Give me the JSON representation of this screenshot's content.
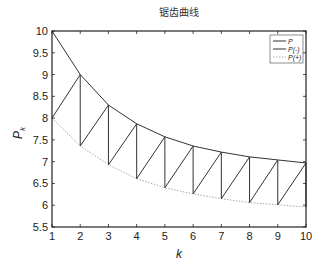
{
  "chart_data": {
    "type": "line",
    "title": "锯齿曲线",
    "xlabel": "k",
    "ylabel": "P_k",
    "ylabel_main": "P",
    "ylabel_sub": "k",
    "xlim": [
      1,
      10
    ],
    "ylim": [
      5.5,
      10
    ],
    "xticks": [
      "1",
      "2",
      "3",
      "4",
      "5",
      "6",
      "7",
      "8",
      "9",
      "10"
    ],
    "yticks": [
      "5.5",
      "6",
      "6.5",
      "7",
      "7.5",
      "8",
      "8.5",
      "9",
      "9.5",
      "10"
    ],
    "grid": false,
    "legend_position": "upper right",
    "x": [
      1,
      2,
      3,
      4,
      5,
      6,
      7,
      8,
      9,
      10
    ],
    "series": [
      {
        "name": "P",
        "style": "solid",
        "color": "#333333",
        "values": [
          10,
          9.0,
          8.3,
          7.87,
          7.57,
          7.36,
          7.22,
          7.11,
          7.04,
          6.97
        ]
      },
      {
        "name": "P(-)",
        "style": "solid-sawtooth",
        "color": "#333333",
        "values": [
          8.0,
          7.36,
          6.93,
          6.61,
          6.4,
          6.26,
          6.15,
          6.06,
          6.01,
          5.96
        ]
      },
      {
        "name": "P(+)",
        "style": "dotted",
        "color": "#aaaaaa",
        "values": [
          8.0,
          7.36,
          6.93,
          6.61,
          6.4,
          6.26,
          6.15,
          6.06,
          6.01,
          5.96
        ]
      }
    ],
    "legend": [
      "P",
      "P(-)",
      "P(+)"
    ]
  }
}
